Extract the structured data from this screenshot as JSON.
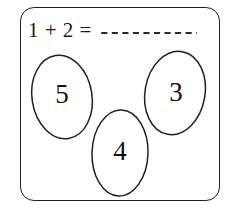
{
  "worksheet": {
    "name": "addition-egg-worksheet",
    "frame_color": "#231f20",
    "background_color": "#ffffff",
    "ink_color": "#1a1a1a"
  },
  "equation": {
    "left_operand": "1",
    "plus_sign": "+",
    "right_operand": "2",
    "equals_sign": "=",
    "expression": "1 + 2 =",
    "answer_value": "",
    "answer_placeholder": "",
    "answer_blank_style": "dashed",
    "answer_blank_dash_count": 9
  },
  "eggs": [
    {
      "id": "egg-left",
      "label": "5",
      "position": "left",
      "cx": 62,
      "cy": 97
    },
    {
      "id": "egg-right",
      "label": "3",
      "position": "right",
      "cx": 176,
      "cy": 95
    },
    {
      "id": "egg-bottom",
      "label": "4",
      "position": "bottom-center",
      "cx": 120,
      "cy": 154
    }
  ]
}
